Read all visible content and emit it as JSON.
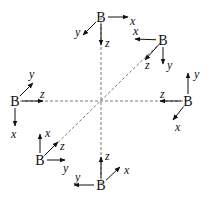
{
  "diagram": {
    "center": [
      101,
      101
    ],
    "dashed_lines": [
      {
        "from": [
          15,
          101
        ],
        "to": [
          188,
          101
        ]
      },
      {
        "from": [
          101,
          17
        ],
        "to": [
          101,
          185
        ]
      },
      {
        "from": [
          40,
          160
        ],
        "to": [
          163,
          40
        ]
      }
    ],
    "frames": [
      {
        "id": "top",
        "origin_label": "B",
        "origin": [
          101,
          17
        ],
        "axes": [
          {
            "label": "x",
            "to": [
              128,
              17
            ],
            "label_pos": [
              130,
              25
            ]
          },
          {
            "label": "y",
            "to": [
              83,
              35
            ],
            "label_pos": [
              75,
              36
            ]
          },
          {
            "label": "z",
            "to": [
              101,
              45
            ],
            "label_pos": [
              105,
              47
            ]
          }
        ]
      },
      {
        "id": "upper-right",
        "origin_label": "B",
        "origin": [
          163,
          40
        ],
        "axes": [
          {
            "label": "x",
            "to": [
              135,
              39
            ],
            "label_pos": [
              133,
              35
            ]
          },
          {
            "label": "z",
            "to": [
              145,
              60
            ],
            "label_pos": [
              145,
              69
            ]
          },
          {
            "label": "y",
            "to": [
              163,
              64
            ],
            "label_pos": [
              167,
              69
            ]
          }
        ]
      },
      {
        "id": "left",
        "origin_label": "B",
        "origin": [
          15,
          101
        ],
        "axes": [
          {
            "label": "y",
            "to": [
              33,
              83
            ],
            "label_pos": [
              29,
              78
            ]
          },
          {
            "label": "z",
            "to": [
              43,
              101
            ],
            "label_pos": [
              40,
              98
            ]
          },
          {
            "label": "x",
            "to": [
              15,
              126
            ],
            "label_pos": [
              11,
              138
            ]
          }
        ]
      },
      {
        "id": "right",
        "origin_label": "B",
        "origin": [
          188,
          101
        ],
        "axes": [
          {
            "label": "y",
            "to": [
              188,
              73
            ],
            "label_pos": [
              194,
              78
            ]
          },
          {
            "label": "z",
            "to": [
              160,
              101
            ],
            "label_pos": [
              160,
              98
            ]
          },
          {
            "label": "x",
            "to": [
              173,
              120
            ],
            "label_pos": [
              175,
              131
            ]
          }
        ]
      },
      {
        "id": "lower-left",
        "origin_label": "B",
        "origin": [
          40,
          160
        ],
        "axes": [
          {
            "label": "x",
            "to": [
              40,
              134
            ],
            "label_pos": [
              45,
              137
            ]
          },
          {
            "label": "z",
            "to": [
              58,
              142
            ],
            "label_pos": [
              60,
              150
            ]
          },
          {
            "label": "y",
            "to": [
              65,
              160
            ],
            "label_pos": [
              63,
              172
            ]
          }
        ]
      },
      {
        "id": "bottom",
        "origin_label": "B",
        "origin": [
          101,
          185
        ],
        "axes": [
          {
            "label": "z",
            "to": [
              101,
              157
            ],
            "label_pos": [
              105,
              160
            ]
          },
          {
            "label": "x",
            "to": [
              120,
              167
            ],
            "label_pos": [
              124,
              174
            ]
          },
          {
            "label": "y",
            "to": [
              74,
              185
            ],
            "label_pos": [
              75,
              181
            ]
          }
        ]
      }
    ]
  }
}
